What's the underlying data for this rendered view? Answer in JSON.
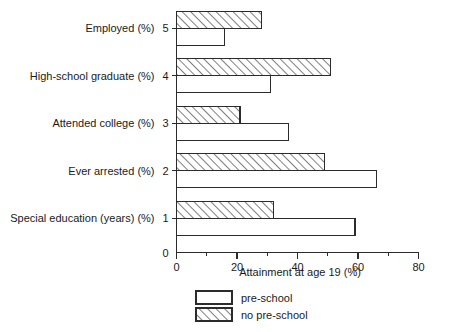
{
  "chart_data": {
    "type": "bar",
    "orientation": "horizontal",
    "title": "",
    "xlabel": "Attainment at age 19 (%)",
    "ylabel": "",
    "xlim": [
      0,
      80
    ],
    "xticks": [
      0,
      20,
      40,
      60,
      80
    ],
    "xtick_labels": [
      "0",
      "20",
      "40",
      "60",
      "80"
    ],
    "xminorticks": [
      10,
      30,
      50,
      70
    ],
    "grid": false,
    "legend_position": "bottom-center",
    "categories": [
      "Special education (years) (%)",
      "Ever arrested (%)",
      "Attended college (%)",
      "High-school graduate (%)",
      "Employed (%)"
    ],
    "category_tick_labels": [
      "1",
      "2",
      "3",
      "4",
      "5"
    ],
    "ytick_zero_label": "0",
    "series": [
      {
        "name": "pre-school",
        "style": "plain",
        "values": [
          59,
          66,
          37,
          31,
          16
        ]
      },
      {
        "name": "no pre-school",
        "style": "hatched",
        "values": [
          32,
          49,
          21,
          51,
          28
        ]
      }
    ]
  },
  "legend": {
    "items": [
      {
        "label": "pre-school",
        "style": "plain"
      },
      {
        "label": "no pre-school",
        "style": "hatched"
      }
    ]
  }
}
